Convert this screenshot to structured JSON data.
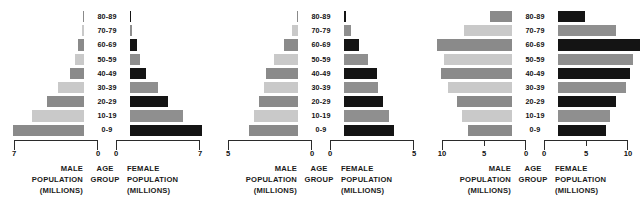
{
  "figure": {
    "kind": "population-pyramid-set",
    "panel_count": 3
  },
  "labels": {
    "male_caption": [
      "MALE",
      "POPULATION",
      "(MILLIONS)"
    ],
    "age_caption": [
      "AGE",
      "GROUP"
    ],
    "female_caption": [
      "FEMALE",
      "POPULATION",
      "(MILLIONS)"
    ],
    "male_line1": "MALE",
    "male_line2": "POPULATION",
    "male_line3": "(MILLIONS)",
    "age_line1": "AGE",
    "age_line2": "GROUP",
    "female_line1": "FEMALE",
    "female_line2": "POPULATION",
    "female_line3": "(MILLIONS)"
  },
  "colors": {
    "male_light": "#c9c9c9",
    "male_dark": "#8a8a8a",
    "female_light": "#8f8f8f",
    "female_dark": "#141414",
    "axis": "#2b2b2b",
    "text": "#111111",
    "background": "#ffffff"
  },
  "chart_data": [
    {
      "type": "bar",
      "orientation": "horizontal",
      "subtype": "population-pyramid",
      "title": "",
      "xlabel": "Population (millions)",
      "ylabel": "Age group",
      "xlim": [
        0,
        7
      ],
      "axis_max": 7,
      "tick_values": [
        7,
        0,
        0,
        7
      ],
      "tick_labels": [
        "7",
        "0",
        "0",
        "7"
      ],
      "mid_tick": false,
      "grid": false,
      "categories": [
        "80-89",
        "70-79",
        "60-69",
        "50-59",
        "40-49",
        "30-39",
        "20-29",
        "10-19",
        "0-9"
      ],
      "series": [
        {
          "name": "Male population (millions)",
          "side": "left",
          "values": [
            0.05,
            0.15,
            0.5,
            0.75,
            1.2,
            2.2,
            3.1,
            4.3,
            5.9
          ]
        },
        {
          "name": "Female population (millions)",
          "side": "right",
          "values": [
            0.1,
            0.2,
            0.55,
            0.8,
            1.3,
            2.3,
            3.2,
            4.4,
            6.0
          ]
        }
      ]
    },
    {
      "type": "bar",
      "orientation": "horizontal",
      "subtype": "population-pyramid",
      "title": "",
      "xlabel": "Population (millions)",
      "ylabel": "Age group",
      "xlim": [
        0,
        5
      ],
      "axis_max": 5,
      "tick_values": [
        5,
        0,
        0,
        5
      ],
      "tick_labels": [
        "5",
        "0",
        "0",
        "5"
      ],
      "mid_tick": false,
      "grid": false,
      "categories": [
        "80-89",
        "70-79",
        "60-69",
        "50-59",
        "40-49",
        "30-39",
        "20-29",
        "10-19",
        "0-9"
      ],
      "series": [
        {
          "name": "Male population (millions)",
          "side": "left",
          "values": [
            0.08,
            0.35,
            0.85,
            1.4,
            1.9,
            2.0,
            2.3,
            2.6,
            2.9
          ]
        },
        {
          "name": "Female population (millions)",
          "side": "right",
          "values": [
            0.1,
            0.4,
            0.9,
            1.45,
            1.95,
            2.05,
            2.35,
            2.65,
            2.95
          ]
        }
      ]
    },
    {
      "type": "bar",
      "orientation": "horizontal",
      "subtype": "population-pyramid",
      "title": "",
      "xlabel": "Population (millions)",
      "ylabel": "Age group",
      "xlim": [
        0,
        10
      ],
      "axis_max": 10,
      "tick_values": [
        10,
        5,
        0,
        0,
        5,
        10
      ],
      "tick_labels": [
        "10",
        "5",
        "0",
        "0",
        "5",
        "10"
      ],
      "mid_tick": true,
      "grid": false,
      "categories": [
        "80-89",
        "70-79",
        "60-69",
        "50-59",
        "40-49",
        "30-39",
        "20-29",
        "10-19",
        "0-9"
      ],
      "series": [
        {
          "name": "Male population (millions)",
          "side": "left",
          "values": [
            2.6,
            5.7,
            8.9,
            8.1,
            8.4,
            7.6,
            6.6,
            5.9,
            5.2
          ]
        },
        {
          "name": "Female population (millions)",
          "side": "right",
          "values": [
            3.2,
            6.9,
            9.8,
            8.9,
            8.6,
            8.1,
            6.9,
            6.2,
            5.7
          ]
        }
      ]
    }
  ]
}
